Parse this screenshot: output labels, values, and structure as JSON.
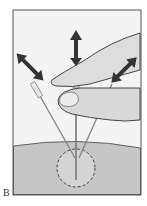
{
  "figure": {
    "panel_label": "B",
    "colors": {
      "background": "#f4f4f4",
      "frame": "#555555",
      "tissue": "#c8c8c8",
      "hand": "#d9d9d9",
      "arrow": "#333333",
      "lesion_outline": "#444444"
    }
  }
}
